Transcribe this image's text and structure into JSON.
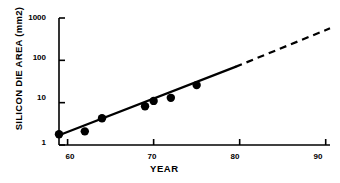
{
  "chart_data": {
    "type": "scatter",
    "title": "",
    "subtitle": "",
    "xlabel": "YEAR",
    "ylabel": "SILICON DIE AREA (mm2)",
    "yscale": "log",
    "xscale": "linear",
    "xlim": [
      59,
      90.5
    ],
    "ylim": [
      1,
      1000
    ],
    "grid": false,
    "legend": null,
    "xticks": [
      {
        "value": 60,
        "label": "60"
      },
      {
        "value": 70,
        "label": "70"
      },
      {
        "value": 80,
        "label": "80"
      },
      {
        "value": 90,
        "label": "90"
      }
    ],
    "yticks": [
      {
        "value": 1,
        "label": "1"
      },
      {
        "value": 10,
        "label": "10"
      },
      {
        "value": 100,
        "label": "100"
      },
      {
        "value": 1000,
        "label": "1000"
      }
    ],
    "series": [
      {
        "name": "Silicon die area measurements",
        "marker": "filled-circle",
        "color": "#000000",
        "x": [
          59,
          62,
          64,
          69,
          70,
          72,
          75
        ],
        "y": [
          1.8,
          2.1,
          4.3,
          8.2,
          11,
          13,
          26
        ]
      }
    ],
    "trend_line": {
      "name": "Fitted growth trend",
      "color": "#000000",
      "style": "solid",
      "x": [
        59,
        79.5
      ],
      "y": [
        1.7,
        70
      ]
    },
    "extrapolation_line": {
      "name": "Extrapolated growth trend",
      "color": "#000000",
      "style": "dashed",
      "x": [
        79.5,
        90.5
      ],
      "y": [
        70,
        570
      ]
    }
  }
}
